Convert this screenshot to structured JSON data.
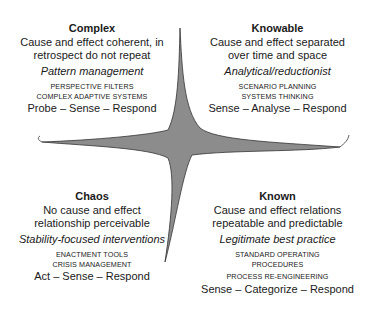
{
  "diagram": {
    "type": "cynefin-framework",
    "colors": {
      "center_fill": "#8c8c8c",
      "line": "#333333",
      "text": "#1a1a1a"
    },
    "quadrants": {
      "complex": {
        "title": "Complex",
        "desc": [
          "Cause and effect coherent, in",
          "retrospect do not repeat"
        ],
        "approach": "Pattern management",
        "tools": [
          "PERSPECTIVE FILTERS",
          "COMPLEX ADAPTIVE SYSTEMS"
        ],
        "response": "Probe – Sense – Respond"
      },
      "knowable": {
        "title": "Knowable",
        "desc": [
          "Cause and effect separated",
          "over time and space"
        ],
        "approach": "Analytical/reductionist",
        "tools": [
          "SCENARIO PLANNING",
          "SYSTEMS THINKING"
        ],
        "response": "Sense – Analyse – Respond"
      },
      "chaos": {
        "title": "Chaos",
        "desc": [
          "No cause and effect",
          "relationship perceivable"
        ],
        "approach": "Stability-focused interventions",
        "tools": [
          "ENACTMENT TOOLS",
          "CRISIS MANAGEMENT"
        ],
        "response": "Act – Sense – Respond"
      },
      "known": {
        "title": "Known",
        "desc": [
          "Cause and effect relations",
          "repeatable and predictable"
        ],
        "approach": "Legitimate best practice",
        "tools": [
          "STANDARD OPERATING",
          "PROCEDURES",
          "PROCESS RE-ENGINEERING"
        ],
        "response": "Sense – Categorize – Respond"
      }
    }
  }
}
